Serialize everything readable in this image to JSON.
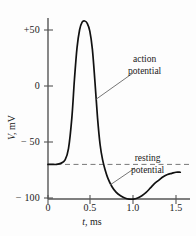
{
  "figure": {
    "background_color": "#fdfdfd",
    "line_color": "#111111",
    "axis_color": "#555555",
    "dash_color": "#777777"
  },
  "axes": {
    "y_title": "V,",
    "y_unit": "mV",
    "x_title": "t,",
    "x_unit": "ms",
    "y_ticks": [
      "+50",
      "0",
      "− 50",
      "− 100"
    ],
    "y_tick_values": [
      50,
      0,
      -50,
      -100
    ],
    "x_ticks": [
      "0",
      "0.5",
      "1.0",
      "1.5"
    ],
    "x_tick_values": [
      0,
      0.5,
      1.0,
      1.5
    ]
  },
  "annotations": {
    "action_line1": "action",
    "action_line2": "potential",
    "resting_line1": "resting",
    "resting_line2": "potential"
  },
  "chart_data": {
    "type": "line",
    "title": "",
    "xlabel": "t, ms",
    "ylabel": "V, mV",
    "xlim": [
      0,
      1.55
    ],
    "ylim": [
      -105,
      70
    ],
    "grid": false,
    "legend": "none",
    "resting_potential": -70,
    "peak_potential": 58,
    "undershoot_potential": -100,
    "annotations": [
      {
        "text": "action potential",
        "target_x": 0.56,
        "target_y": 0.0,
        "label_x": 0.95,
        "label_y": 30
      },
      {
        "text": "resting potential",
        "target_x": 0.78,
        "target_y": -70,
        "label_x": 1.0,
        "label_y": -48
      }
    ],
    "reference_lines": [
      {
        "type": "horizontal",
        "y": -70,
        "style": "dashed",
        "label": "resting potential"
      }
    ],
    "series": [
      {
        "name": "membrane potential",
        "x": [
          0.0,
          0.05,
          0.1,
          0.15,
          0.2,
          0.24,
          0.28,
          0.31,
          0.34,
          0.37,
          0.4,
          0.43,
          0.46,
          0.49,
          0.52,
          0.55,
          0.58,
          0.61,
          0.64,
          0.67,
          0.7,
          0.75,
          0.8,
          0.85,
          0.9,
          0.95,
          1.0,
          1.05,
          1.1,
          1.15,
          1.2,
          1.25,
          1.3,
          1.35,
          1.4,
          1.45,
          1.5,
          1.55
        ],
        "y": [
          -70,
          -70,
          -70,
          -69,
          -66,
          -56,
          -28,
          6,
          34,
          50,
          57,
          58,
          56,
          49,
          33,
          4,
          -28,
          -52,
          -66,
          -75,
          -82,
          -90,
          -95,
          -98,
          -100,
          -101,
          -101,
          -100,
          -98,
          -95,
          -91,
          -87,
          -84,
          -81,
          -79,
          -78,
          -77,
          -77
        ]
      }
    ]
  }
}
